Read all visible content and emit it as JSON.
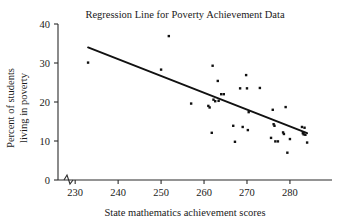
{
  "chart_data": {
    "type": "scatter",
    "title": "Regression Line for Poverty Achievement Data",
    "xlabel": "State mathematics achievement scores",
    "ylabel_line1": "Percent of students",
    "ylabel_line2": "living in poverty",
    "xlim": [
      226,
      287
    ],
    "ylim": [
      0,
      40
    ],
    "xticks": [
      230,
      240,
      250,
      260,
      270,
      280
    ],
    "yticks": [
      0,
      10,
      20,
      30,
      40
    ],
    "grid": false,
    "legend": null,
    "axis_break": {
      "axis": "x",
      "between": [
        226,
        229
      ],
      "symbol": "zigzag"
    },
    "marker": {
      "shape": "square",
      "color": "#111111",
      "size_px": 2.4
    },
    "regression_line": {
      "color": "#111111",
      "x_start": 233.0,
      "y_start": 34.0,
      "x_end": 284.0,
      "y_end": 12.0,
      "slope": -0.431,
      "intercept": 134.5
    },
    "points": [
      {
        "x": 233.0,
        "y": 30.1
      },
      {
        "x": 250.0,
        "y": 28.3
      },
      {
        "x": 251.8,
        "y": 36.9
      },
      {
        "x": 257.0,
        "y": 19.6
      },
      {
        "x": 261.0,
        "y": 19.0
      },
      {
        "x": 261.3,
        "y": 18.6
      },
      {
        "x": 261.8,
        "y": 12.1
      },
      {
        "x": 262.0,
        "y": 29.3
      },
      {
        "x": 262.2,
        "y": 20.6
      },
      {
        "x": 262.6,
        "y": 20.2
      },
      {
        "x": 263.2,
        "y": 25.4
      },
      {
        "x": 263.4,
        "y": 20.3
      },
      {
        "x": 264.0,
        "y": 22.0
      },
      {
        "x": 264.6,
        "y": 22.0
      },
      {
        "x": 266.8,
        "y": 13.9
      },
      {
        "x": 267.2,
        "y": 9.8
      },
      {
        "x": 268.4,
        "y": 23.5
      },
      {
        "x": 269.0,
        "y": 13.6
      },
      {
        "x": 269.8,
        "y": 26.9
      },
      {
        "x": 270.0,
        "y": 23.5
      },
      {
        "x": 270.2,
        "y": 12.8
      },
      {
        "x": 270.4,
        "y": 17.4
      },
      {
        "x": 273.0,
        "y": 23.6
      },
      {
        "x": 275.6,
        "y": 10.8
      },
      {
        "x": 276.0,
        "y": 18.0
      },
      {
        "x": 276.2,
        "y": 14.3
      },
      {
        "x": 276.4,
        "y": 13.9
      },
      {
        "x": 276.6,
        "y": 9.9
      },
      {
        "x": 277.2,
        "y": 9.9
      },
      {
        "x": 278.4,
        "y": 12.2
      },
      {
        "x": 278.6,
        "y": 11.8
      },
      {
        "x": 279.0,
        "y": 18.7
      },
      {
        "x": 279.4,
        "y": 7.0
      },
      {
        "x": 280.0,
        "y": 10.5
      },
      {
        "x": 282.8,
        "y": 13.6
      },
      {
        "x": 283.0,
        "y": 12.0
      },
      {
        "x": 283.2,
        "y": 11.7
      },
      {
        "x": 283.4,
        "y": 13.4
      },
      {
        "x": 283.6,
        "y": 11.6
      },
      {
        "x": 284.0,
        "y": 9.6
      }
    ]
  }
}
